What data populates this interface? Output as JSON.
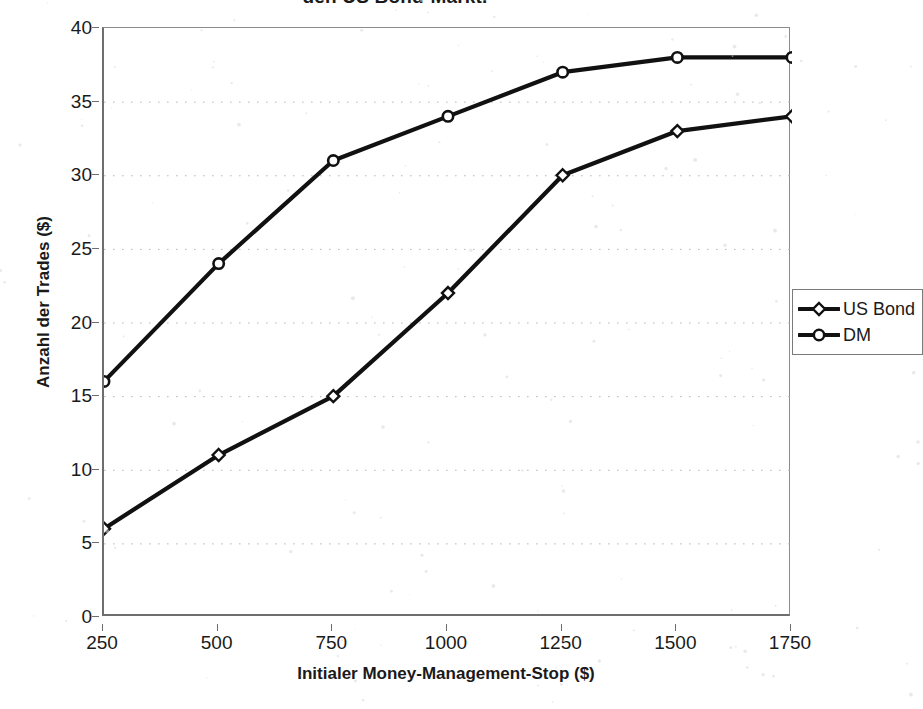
{
  "chart_data": {
    "type": "line",
    "title": "den US Bond-Markt.",
    "xlabel": "Initialer Money-Management-Stop ($)",
    "ylabel": "Anzahl der Trades ($)",
    "categories": [
      "250",
      "500",
      "750",
      "1000",
      "1250",
      "1500",
      "1750"
    ],
    "x_tick_labels": [
      "250",
      "500",
      "750",
      "1000",
      "1250",
      "1500",
      "1750"
    ],
    "y_tick_labels": [
      "40",
      "35",
      "30",
      "25",
      "20",
      "15",
      "10",
      "5",
      "0"
    ],
    "ylim": [
      0,
      40
    ],
    "y_tick_step": 5,
    "grid": "horizontal-dotted",
    "legend_position": "right",
    "series": [
      {
        "name": "US Bond",
        "marker": "diamond-open",
        "color": "#111111",
        "values": [
          6,
          11,
          15,
          22,
          30,
          33,
          34
        ]
      },
      {
        "name": "DM",
        "marker": "circle-open",
        "color": "#111111",
        "values": [
          16,
          24,
          31,
          34,
          37,
          38,
          38
        ]
      }
    ]
  },
  "legend": {
    "items": [
      {
        "label": "US Bond",
        "marker": "diamond-open"
      },
      {
        "label": "DM",
        "marker": "circle-open"
      }
    ]
  },
  "colors": {
    "line": "#111111",
    "axis": "#6e6e6e",
    "grid": "#b9b9b9",
    "text": "#1a1a1a",
    "background": "#ffffff"
  }
}
